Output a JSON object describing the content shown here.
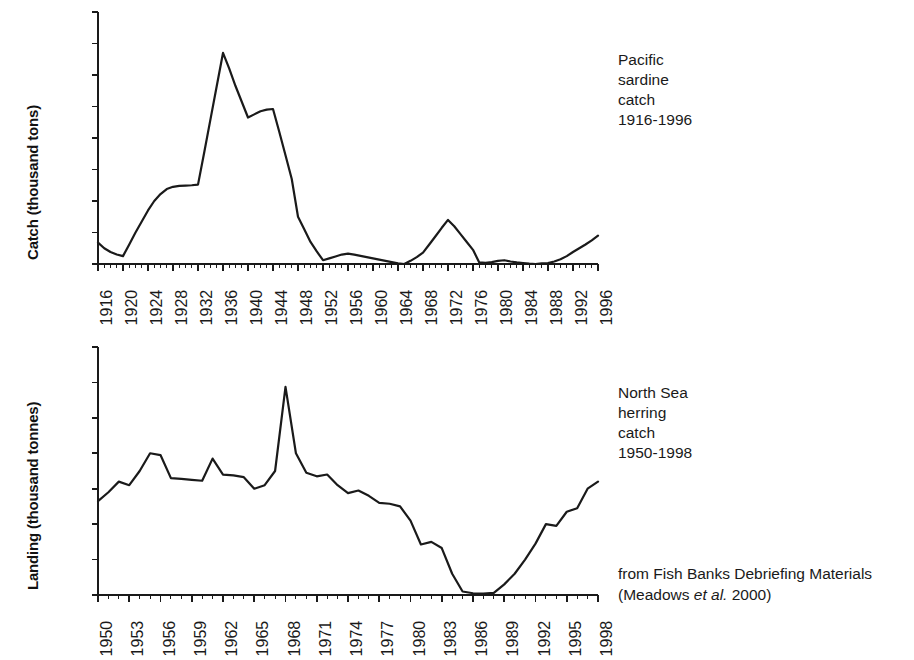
{
  "figure": {
    "background": "#ffffff",
    "line_color": "#1a1a1a",
    "axis_color": "#1a1a1a"
  },
  "credit": {
    "line1": "from Fish Banks Debriefing Materials",
    "line2_pre": "(Meadows ",
    "line2_ital": "et al.",
    "line2_post": " 2000)"
  },
  "panels": [
    {
      "id": "sardine",
      "annotation": [
        "Pacific",
        "sardine",
        "catch",
        "1916-1996"
      ],
      "chart_data": {
        "type": "line",
        "title": "Pacific sardine catch 1916-1996",
        "xlabel": "",
        "ylabel": "Catch (thousand tons)",
        "ylim": [
          0,
          800
        ],
        "yticks": [
          0,
          100,
          200,
          300,
          400,
          500,
          600,
          700,
          800
        ],
        "xlim": [
          1916,
          1996
        ],
        "xticks": [
          1916,
          1920,
          1924,
          1928,
          1932,
          1936,
          1940,
          1944,
          1948,
          1952,
          1956,
          1960,
          1964,
          1968,
          1972,
          1976,
          1980,
          1984,
          1988,
          1992,
          1996
        ],
        "xtick_step": 4,
        "grid": false,
        "legend": "none",
        "x": [
          1916,
          1917,
          1918,
          1919,
          1920,
          1921,
          1922,
          1923,
          1924,
          1925,
          1926,
          1927,
          1928,
          1929,
          1930,
          1931,
          1932,
          1933,
          1934,
          1935,
          1936,
          1937,
          1938,
          1939,
          1940,
          1941,
          1942,
          1943,
          1944,
          1945,
          1946,
          1947,
          1948,
          1949,
          1950,
          1951,
          1952,
          1953,
          1954,
          1955,
          1956,
          1957,
          1958,
          1959,
          1960,
          1961,
          1962,
          1963,
          1964,
          1965,
          1966,
          1967,
          1968,
          1969,
          1970,
          1971,
          1972,
          1973,
          1974,
          1975,
          1976,
          1977,
          1978,
          1979,
          1980,
          1981,
          1982,
          1983,
          1984,
          1985,
          1986,
          1987,
          1988,
          1989,
          1990,
          1991,
          1992,
          1993,
          1994,
          1995,
          1996
        ],
        "y": [
          68,
          50,
          38,
          30,
          25,
          62,
          100,
          135,
          170,
          200,
          222,
          238,
          245,
          248,
          249,
          250,
          252,
          355,
          460,
          565,
          670,
          620,
          565,
          515,
          465,
          475,
          485,
          490,
          492,
          420,
          345,
          270,
          150,
          110,
          70,
          40,
          12,
          18,
          24,
          30,
          33,
          30,
          26,
          22,
          18,
          14,
          10,
          6,
          2,
          0,
          10,
          22,
          36,
          62,
          88,
          115,
          140,
          120,
          95,
          70,
          45,
          5,
          4,
          6,
          10,
          12,
          8,
          5,
          3,
          1,
          0,
          2,
          3,
          8,
          15,
          25,
          38,
          50,
          62,
          75,
          90
        ]
      }
    },
    {
      "id": "herring",
      "annotation": [
        "North Sea",
        "herring",
        "catch",
        "1950-1998"
      ],
      "chart_data": {
        "type": "line",
        "title": "North Sea herring catch 1950-1998",
        "xlabel": "",
        "ylabel": "Landing (thousand tonnes)",
        "ylim": [
          0,
          1400
        ],
        "yticks": [
          0,
          200,
          400,
          600,
          800,
          1000,
          1200,
          1400
        ],
        "xlim": [
          1950,
          1998
        ],
        "xticks": [
          1950,
          1953,
          1956,
          1959,
          1962,
          1965,
          1968,
          1971,
          1974,
          1977,
          1980,
          1983,
          1986,
          1989,
          1992,
          1995,
          1998
        ],
        "xtick_step": 3,
        "grid": false,
        "legend": "none",
        "x": [
          1950,
          1951,
          1952,
          1953,
          1954,
          1955,
          1956,
          1957,
          1958,
          1959,
          1960,
          1961,
          1962,
          1963,
          1964,
          1965,
          1966,
          1967,
          1968,
          1969,
          1970,
          1971,
          1972,
          1973,
          1974,
          1975,
          1976,
          1977,
          1978,
          1979,
          1980,
          1981,
          1982,
          1983,
          1984,
          1985,
          1986,
          1987,
          1988,
          1989,
          1990,
          1991,
          1992,
          1993,
          1994,
          1995,
          1996,
          1997,
          1998
        ],
        "y": [
          530,
          580,
          640,
          620,
          700,
          800,
          790,
          660,
          655,
          650,
          645,
          770,
          680,
          675,
          665,
          600,
          620,
          700,
          1175,
          800,
          690,
          670,
          680,
          620,
          575,
          590,
          560,
          520,
          515,
          500,
          420,
          285,
          300,
          265,
          120,
          20,
          10,
          8,
          12,
          60,
          120,
          200,
          290,
          400,
          390,
          470,
          490,
          600,
          640
        ]
      }
    }
  ]
}
